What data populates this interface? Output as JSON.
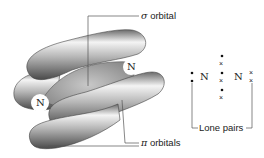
{
  "diagram": {
    "labels": {
      "sigma": {
        "symbol": "σ",
        "text": "orbital"
      },
      "pi": {
        "symbol": "π",
        "text": "orbitals"
      },
      "lone_pairs": "Lone pairs"
    },
    "atoms": {
      "left_3d": "N",
      "right_3d": "N",
      "lewis_left": "N",
      "lewis_right": "N"
    },
    "lewis_structure": {
      "left_lone_pair": [
        "•",
        "•"
      ],
      "shared_column": [
        "•",
        "×",
        "•",
        "×",
        "•",
        "×"
      ],
      "right_lone_pair": [
        "×",
        "×"
      ]
    },
    "colors": {
      "orbital_light": "#f2f2f2",
      "orbital_dark": "#555555",
      "sigma_fill": "#a9a9a9",
      "leader_line": "#555555"
    }
  }
}
